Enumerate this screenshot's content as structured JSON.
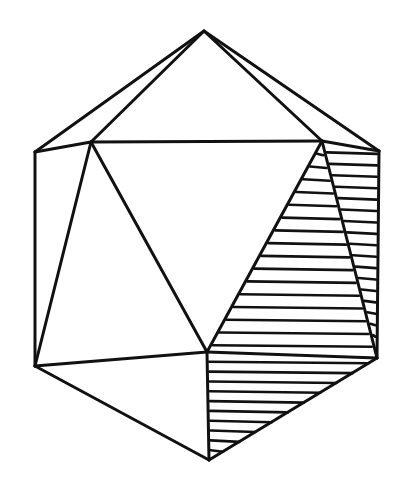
{
  "figure": {
    "colors": {
      "background": "#ffffff",
      "line": "#111111"
    },
    "vertices": {
      "T": [
        204,
        31
      ],
      "L1": [
        35,
        152
      ],
      "IL": [
        91,
        142
      ],
      "IR": [
        322,
        141
      ],
      "R1": [
        379,
        151
      ],
      "L2": [
        35,
        366
      ],
      "C": [
        207,
        352
      ],
      "R2": [
        377,
        358
      ],
      "B": [
        209,
        460
      ]
    },
    "edges": [
      [
        "T",
        "L1"
      ],
      [
        "T",
        "IL"
      ],
      [
        "T",
        "IR"
      ],
      [
        "T",
        "R1"
      ],
      [
        "L1",
        "IL"
      ],
      [
        "IL",
        "IR"
      ],
      [
        "IR",
        "R1"
      ],
      [
        "L1",
        "L2"
      ],
      [
        "R1",
        "R2"
      ],
      [
        "IL",
        "L2"
      ],
      [
        "IL",
        "C"
      ],
      [
        "IR",
        "C"
      ],
      [
        "IR",
        "R2"
      ],
      [
        "L2",
        "C"
      ],
      [
        "C",
        "R2"
      ],
      [
        "L2",
        "B"
      ],
      [
        "C",
        "B"
      ],
      [
        "R2",
        "B"
      ]
    ],
    "hatched_faces": [
      {
        "name": "front-right-face",
        "vertices": [
          "IR",
          "C",
          "R2"
        ],
        "lines": 16
      },
      {
        "name": "side-right-face",
        "vertices": [
          "IR",
          "R1",
          "R2"
        ],
        "lines": 18
      },
      {
        "name": "bottom-right-face",
        "vertices": [
          "C",
          "R2",
          "B"
        ],
        "lines": 10
      }
    ]
  }
}
